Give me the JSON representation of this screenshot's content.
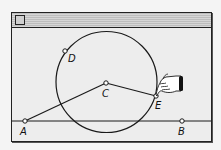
{
  "window": {
    "title": ""
  },
  "diagram": {
    "circle": {
      "center": "C",
      "cx": 106.5,
      "cy": 82,
      "r": 50.5
    },
    "points": [
      {
        "name": "A",
        "x": 25,
        "y": 121,
        "label": "A"
      },
      {
        "name": "B",
        "x": 182,
        "y": 121,
        "label": "B"
      },
      {
        "name": "C",
        "x": 106,
        "y": 83,
        "label": "C"
      },
      {
        "name": "D",
        "x": 65,
        "y": 51,
        "label": "D"
      },
      {
        "name": "E",
        "x": 156,
        "y": 96,
        "label": "E"
      }
    ],
    "segments": [
      {
        "from": "A",
        "to": "C"
      },
      {
        "from": "C",
        "to": "E"
      }
    ],
    "line": {
      "through": [
        "A",
        "B"
      ]
    },
    "cursor": {
      "type": "hand-pointer",
      "target": "E"
    }
  },
  "colors": {
    "stroke": "#1a1a1a",
    "background": "#ededed",
    "titlebar": "#c8c8c8"
  }
}
